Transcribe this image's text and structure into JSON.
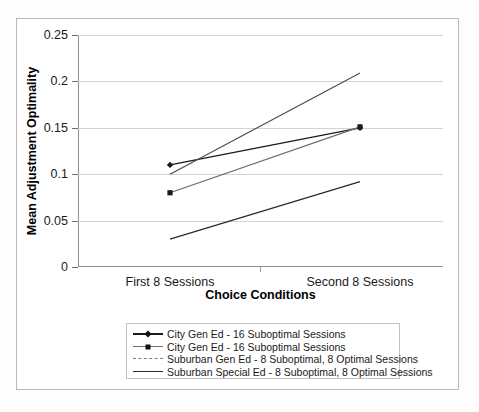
{
  "chart_data": {
    "type": "line",
    "title": "",
    "xlabel": "Choice Conditions",
    "ylabel": "Mean Adjustment Optimality",
    "categories": [
      "First 8 Sessions",
      "Second 8 Sessions"
    ],
    "ylim": [
      0,
      0.25
    ],
    "yticks": [
      "0",
      "0.05",
      "0.1",
      "0.15",
      "0.2",
      "0.25"
    ],
    "ytick_values": [
      0,
      0.05,
      0.1,
      0.15,
      0.2,
      0.25
    ],
    "grid": true,
    "legend_position": "bottom",
    "series": [
      {
        "name": "City Gen Ed - 16 Suboptimal Sessions",
        "marker": "diamond",
        "line_style": "solid",
        "color": "#1a1a1a",
        "values": [
          0.11,
          0.15
        ]
      },
      {
        "name": "City Gen Ed - 16 Suboptimal Sessions",
        "marker": "square",
        "line_style": "solid",
        "color": "#6e6e6e",
        "values": [
          0.08,
          0.151
        ]
      },
      {
        "name": "Suburban Gen Ed - 8 Suboptimal, 8 Optimal Sessions",
        "marker": "none",
        "line_style": "dashed",
        "color": "#4a4a4a",
        "values": [
          0.1,
          0.209
        ]
      },
      {
        "name": "Suburban Special Ed - 8 Suboptimal, 8 Optimal Sessions",
        "marker": "none",
        "line_style": "solid",
        "color": "#2b2b2b",
        "values": [
          0.03,
          0.092
        ]
      }
    ]
  },
  "axis": {
    "y_title": "Mean Adjustment Optimality",
    "x_title": "Choice Conditions",
    "y_tick_labels": [
      "0.25",
      "0.2",
      "0.15",
      "0.1",
      "0.05",
      "0"
    ],
    "x_cat_labels": [
      "First 8 Sessions",
      "Second 8 Sessions"
    ]
  },
  "legend": {
    "entries": [
      {
        "label": "City Gen Ed - 16 Suboptimal Sessions",
        "key": "diamond-line-key"
      },
      {
        "label": "City Gen Ed - 16 Suboptimal Sessions",
        "key": "square-line-key"
      },
      {
        "label": "Suburban Gen Ed - 8 Suboptimal, 8 Optimal Sessions",
        "key": "dashed-line-key"
      },
      {
        "label": "Suburban Special Ed - 8 Suboptimal, 8 Optimal Sessions",
        "key": "solid-line-key"
      }
    ]
  },
  "colors": {
    "grid": "#d3d3d3",
    "axis": "#8f8f8f",
    "frame": "#b9b9b9",
    "text": "#1a1a1a",
    "background": "#ffffff"
  }
}
